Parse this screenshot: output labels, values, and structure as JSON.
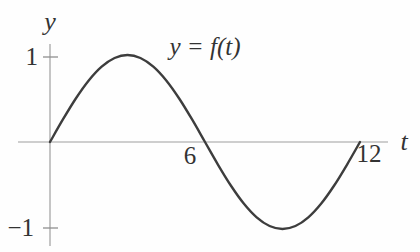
{
  "figure": {
    "background": "#fefefe"
  },
  "chart_data": {
    "type": "line",
    "title": "",
    "xlabel": "t",
    "ylabel": "y",
    "function_label": "y = f(t)",
    "xlim": [
      0,
      12
    ],
    "ylim": [
      -1.2,
      1.2
    ],
    "x_tick_labels": [
      "6",
      "12"
    ],
    "x_tick_values": [
      6,
      12
    ],
    "y_tick_labels": [
      "1",
      "−1"
    ],
    "y_tick_values": [
      1,
      -1
    ],
    "grid": false,
    "legend": "none",
    "colors": {
      "curve": "#3d3d3d",
      "axis": "#9e9e9e",
      "tick": "#8f8f8f",
      "text": "#333333"
    },
    "series": [
      {
        "name": "f(t)",
        "x": [
          0,
          0.5,
          1,
          1.5,
          2,
          2.5,
          3,
          3.5,
          4,
          4.5,
          5,
          5.5,
          6,
          6.5,
          7,
          7.5,
          8,
          8.5,
          9,
          9.5,
          10,
          10.5,
          11,
          11.5,
          12
        ],
        "y": [
          0,
          0.2588,
          0.5,
          0.7071,
          0.866,
          0.9659,
          1,
          0.9659,
          0.866,
          0.7071,
          0.5,
          0.2588,
          0,
          -0.2588,
          -0.5,
          -0.7071,
          -0.866,
          -0.9659,
          -1,
          -0.9659,
          -0.866,
          -0.7071,
          -0.5,
          -0.2588,
          0
        ]
      }
    ]
  }
}
